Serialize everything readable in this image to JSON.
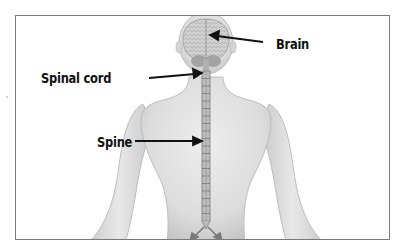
{
  "diagram": {
    "title": "",
    "labels": {
      "brain": "Brain",
      "spinal_cord": "Spinal cord",
      "spine": "Spine"
    },
    "colors": {
      "background": "#ffffff",
      "frame": "#7a7a7a",
      "body": "#d9d9d9",
      "body_edge": "#bdbdbd",
      "brain": "#c4c4c4",
      "cerebellum": "#9e9e9e",
      "spine": "#8a8a8a",
      "label_text": "#111111",
      "arrow": "#111111"
    },
    "vertebrae_count": 20
  }
}
